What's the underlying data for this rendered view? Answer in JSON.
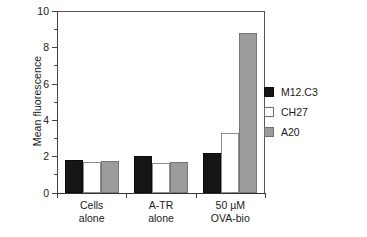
{
  "chart_data": {
    "type": "bar",
    "title": "",
    "xlabel": "",
    "ylabel": "Mean fluorescence",
    "ylim": [
      0,
      10
    ],
    "ytick_values": [
      0,
      2,
      4,
      6,
      8,
      10
    ],
    "ytick_labels": [
      "0",
      "2",
      "4",
      "6",
      "8",
      "10"
    ],
    "yminor_tick_values": [
      1,
      3,
      5,
      7,
      9
    ],
    "grid": false,
    "legend_position": "right",
    "categories": [
      "Cells alone",
      "A-TR alone",
      "50 µM OVA-bio"
    ],
    "category_lines": [
      [
        "Cells",
        "alone"
      ],
      [
        "A-TR",
        "alone"
      ],
      [
        "50 µM",
        "OVA-bio"
      ]
    ],
    "series": [
      {
        "name": "M12.C3",
        "color": "#151515",
        "values": [
          1.8,
          2.0,
          2.15
        ]
      },
      {
        "name": "CH27",
        "color": "#ffffff",
        "values": [
          1.7,
          1.65,
          3.3
        ]
      },
      {
        "name": "A20",
        "color": "#9b9b9b",
        "values": [
          1.72,
          1.7,
          8.8
        ]
      }
    ]
  },
  "legend": {
    "entries": [
      {
        "label": "M12.C3"
      },
      {
        "label": "CH27"
      },
      {
        "label": "A20"
      }
    ]
  },
  "axes": {
    "y_title": "Mean fluorescence"
  }
}
